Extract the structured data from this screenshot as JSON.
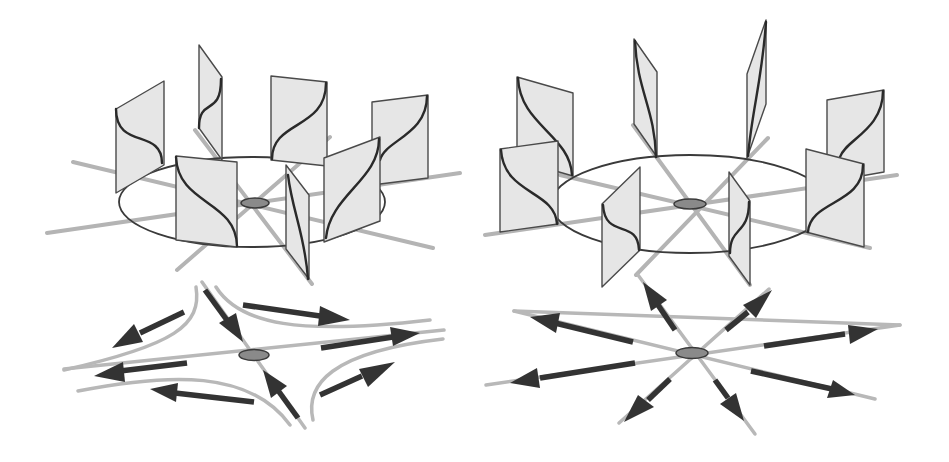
{
  "figure": {
    "panels": [
      {
        "id": "left",
        "type": "saddle",
        "top": {
          "label": "",
          "panel_count": 7,
          "center": [
            255,
            203
          ]
        },
        "bottom": {
          "label": "",
          "pattern": "hyperbolic saddle flow",
          "center": [
            254,
            355
          ],
          "arrow_count": 8
        }
      },
      {
        "id": "right",
        "type": "source",
        "top": {
          "label": "",
          "panel_count": 8,
          "center": [
            690,
            204
          ]
        },
        "bottom": {
          "label": "",
          "pattern": "radial outflow (node/source)",
          "center": [
            692,
            353
          ],
          "arrow_count": 8
        }
      }
    ],
    "colors": {
      "background": "#ffffff",
      "axis_lines": "#b4b4b4",
      "panel_fill": "#e6e6e6",
      "outline": "#3a3a3a",
      "center_node": "#8a8a8a",
      "arrows": "#333333"
    }
  }
}
